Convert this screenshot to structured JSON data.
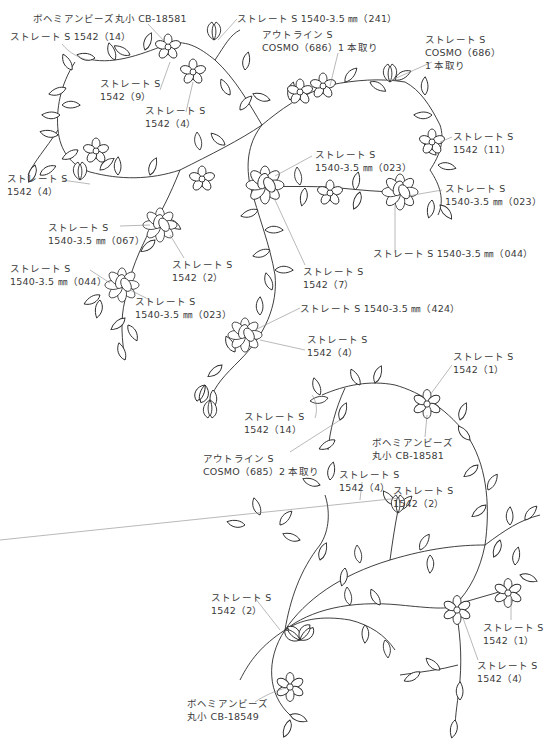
{
  "diagram": {
    "type": "embroidery-pattern",
    "labels": [
      {
        "id": "bead-top",
        "lines": [
          "ボヘミアンビーズ丸小 CB-18581"
        ],
        "x": 33,
        "y": 12
      },
      {
        "id": "straight-1542-14-top",
        "lines": [
          "ストレート S 1542（14）"
        ],
        "x": 10,
        "y": 30
      },
      {
        "id": "straight-1540-241",
        "lines": [
          "ストレート S 1540-3.5 ㎜（241）"
        ],
        "x": 237,
        "y": 12
      },
      {
        "id": "outline-686",
        "lines": [
          "アウトライン S",
          "COSMO（686）1 本取り"
        ],
        "x": 262,
        "y": 28
      },
      {
        "id": "straight-686",
        "lines": [
          "ストレート S",
          "COSMO（686）",
          "1 本取り"
        ],
        "x": 425,
        "y": 33
      },
      {
        "id": "straight-1542-9",
        "lines": [
          "ストレート S",
          "1542（9）"
        ],
        "x": 100,
        "y": 77
      },
      {
        "id": "straight-1542-4-a",
        "lines": [
          "ストレート S",
          "1542（4）"
        ],
        "x": 145,
        "y": 104
      },
      {
        "id": "straight-1542-11",
        "lines": [
          "ストレート S",
          "1542（11）"
        ],
        "x": 453,
        "y": 130
      },
      {
        "id": "straight-1540-023-a",
        "lines": [
          "ストレート S",
          "1540-3.5 ㎜（023）"
        ],
        "x": 315,
        "y": 148
      },
      {
        "id": "straight-1542-4-b",
        "lines": [
          "ストレート S",
          "1542（4）"
        ],
        "x": 7,
        "y": 172
      },
      {
        "id": "straight-1540-023-b",
        "lines": [
          "ストレート S",
          "1540-3.5 ㎜（023）"
        ],
        "x": 445,
        "y": 182
      },
      {
        "id": "straight-1540-067",
        "lines": [
          "ストレート S",
          "1540-3.5 ㎜（067）"
        ],
        "x": 48,
        "y": 221
      },
      {
        "id": "straight-1540-044-a",
        "lines": [
          "ストレート S 1540-3.5 ㎜（044）"
        ],
        "x": 373,
        "y": 247
      },
      {
        "id": "straight-1542-2-a",
        "lines": [
          "ストレート S",
          "1542（2）"
        ],
        "x": 172,
        "y": 258
      },
      {
        "id": "straight-1540-044-b",
        "lines": [
          "ストレート S",
          "1540-3.5 ㎜（044）"
        ],
        "x": 10,
        "y": 262
      },
      {
        "id": "straight-1542-7",
        "lines": [
          "ストレート S",
          "1542（7）"
        ],
        "x": 303,
        "y": 265
      },
      {
        "id": "straight-1540-023-c",
        "lines": [
          "ストレート S",
          "1540-3.5 ㎜（023）"
        ],
        "x": 135,
        "y": 295
      },
      {
        "id": "straight-1540-424",
        "lines": [
          "ストレート S 1540-3.5 ㎜（424）"
        ],
        "x": 300,
        "y": 302
      },
      {
        "id": "straight-1542-4-c",
        "lines": [
          "ストレート S",
          "1542（4）"
        ],
        "x": 307,
        "y": 333
      },
      {
        "id": "straight-1542-1-a",
        "lines": [
          "ストレート S",
          "1542（1）"
        ],
        "x": 453,
        "y": 350
      },
      {
        "id": "straight-1542-14-b",
        "lines": [
          "ストレート S",
          "1542（14）"
        ],
        "x": 244,
        "y": 410
      },
      {
        "id": "bead-mid",
        "lines": [
          "ボヘミアンビーズ",
          "丸小 CB-18581"
        ],
        "x": 372,
        "y": 436
      },
      {
        "id": "outline-685",
        "lines": [
          "アウトライン S",
          "COSMO（685）2 本取り"
        ],
        "x": 203,
        "y": 452
      },
      {
        "id": "straight-1542-4-d",
        "lines": [
          "ストレート S",
          "1542（4）"
        ],
        "x": 339,
        "y": 468
      },
      {
        "id": "straight-1542-2-b",
        "lines": [
          "ストレート S",
          "1542（2）"
        ],
        "x": 393,
        "y": 484
      },
      {
        "id": "straight-1542-2-c",
        "lines": [
          "ストレート S",
          "1542（2）"
        ],
        "x": 211,
        "y": 591
      },
      {
        "id": "straight-1542-1-b",
        "lines": [
          "ストレート S",
          "1542（1）"
        ],
        "x": 483,
        "y": 621
      },
      {
        "id": "straight-1542-4-e",
        "lines": [
          "ストレート S",
          "1542（4）"
        ],
        "x": 477,
        "y": 659
      },
      {
        "id": "bead-bottom",
        "lines": [
          "ボヘミアンビーズ",
          "丸小 CB-18549"
        ],
        "x": 187,
        "y": 697
      }
    ]
  }
}
